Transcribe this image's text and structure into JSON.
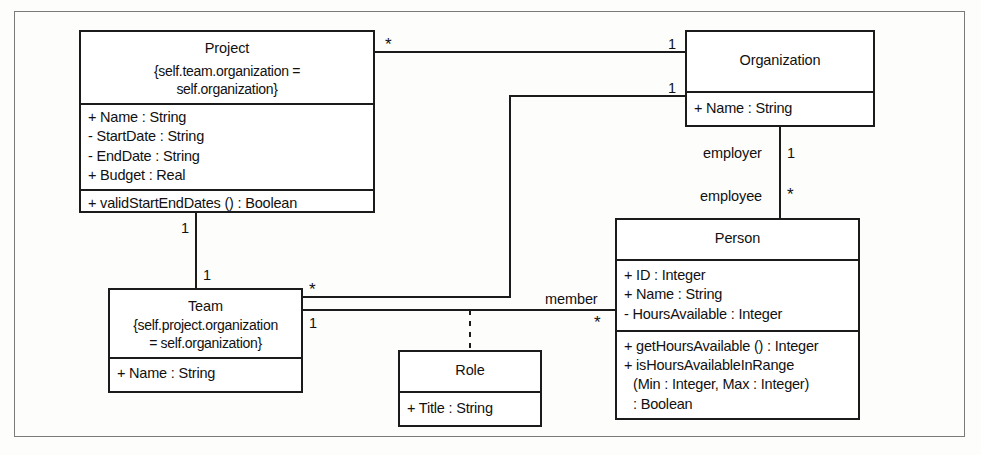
{
  "diagram": {
    "kind": "uml-class-diagram",
    "title": "",
    "background_color": "#fdfdfc",
    "line_color": "#1b1b1b",
    "frame_color": "#7a7a78"
  },
  "classes": {
    "project": {
      "name": "Project",
      "constraint": [
        "{self.team.organization =",
        "self.organization}"
      ],
      "attributes": [
        "+ Name : String",
        "- StartDate : String",
        "- EndDate : String",
        "+ Budget : Real"
      ],
      "operations": [
        "+ validStartEndDates () : Boolean"
      ]
    },
    "organization": {
      "name": "Organization",
      "constraint": [],
      "attributes": [
        "+ Name : String"
      ],
      "operations": []
    },
    "team": {
      "name": "Team",
      "constraint": [
        "{self.project.organization",
        "= self.organization}"
      ],
      "attributes": [
        "+ Name : String"
      ],
      "operations": []
    },
    "role": {
      "name": "Role",
      "constraint": [],
      "attributes": [
        "+ Title : String"
      ],
      "operations": []
    },
    "person": {
      "name": "Person",
      "constraint": [],
      "attributes": [
        "+ ID : Integer",
        "+ Name : String",
        "- HoursAvailable : Integer"
      ],
      "operations": [
        "+ getHoursAvailable () : Integer",
        "+ isHoursAvailableInRange",
        "(Min : Integer, Max : Integer)",
        ": Boolean"
      ]
    }
  },
  "associations": {
    "project_organization": {
      "end_from_multiplicity": "*",
      "end_to_multiplicity": "1"
    },
    "project_team": {
      "end_from_multiplicity": "1",
      "end_to_multiplicity": "1"
    },
    "team_organization": {
      "end_from_multiplicity": "*",
      "end_to_multiplicity": "1"
    },
    "organization_person": {
      "end_from_role": "employer",
      "end_from_multiplicity": "1",
      "end_to_role": "employee",
      "end_to_multiplicity": "*"
    },
    "team_person": {
      "label": "member",
      "end_from_multiplicity": "1",
      "end_to_multiplicity": "*",
      "association_class": "Role"
    }
  }
}
